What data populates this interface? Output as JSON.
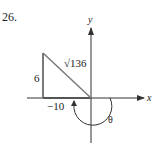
{
  "problem_number": "26.",
  "axes": {
    "x_label": "x",
    "y_label": "y"
  },
  "triangle": {
    "vertical_side_label": "6",
    "horizontal_side_label": "−10",
    "hypotenuse_label": "√136"
  },
  "angle": {
    "label": "θ"
  },
  "colors": {
    "triangle_stroke": "#7a7a7a",
    "axis_stroke": "#333333",
    "text": "#222222"
  }
}
